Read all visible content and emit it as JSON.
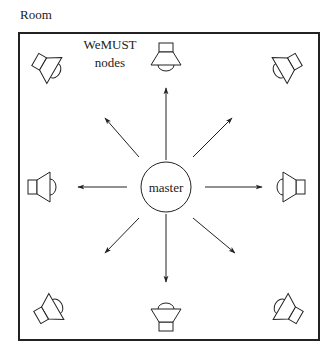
{
  "diagram": {
    "room_label": "Room",
    "nodes_label_line1": "WeMUST",
    "nodes_label_line2": "nodes",
    "master_label": "master",
    "caption_partial": "",
    "stroke_color": "#222222",
    "background": "#ffffff",
    "layout": {
      "room_rect": {
        "x": 19,
        "y": 33,
        "w": 300,
        "h": 307
      },
      "master_center": [
        166,
        187
      ],
      "master_radius": 25,
      "speakers": [
        {
          "position": "top-left",
          "orientation": "diagonal",
          "facing": "center"
        },
        {
          "position": "top-center",
          "orientation": "vertical",
          "facing": "down"
        },
        {
          "position": "top-right",
          "orientation": "diagonal",
          "facing": "center"
        },
        {
          "position": "middle-left",
          "orientation": "horizontal",
          "facing": "right"
        },
        {
          "position": "middle-right",
          "orientation": "horizontal",
          "facing": "left"
        },
        {
          "position": "bottom-left",
          "orientation": "diagonal",
          "facing": "center"
        },
        {
          "position": "bottom-center",
          "orientation": "vertical",
          "facing": "up"
        },
        {
          "position": "bottom-right",
          "orientation": "diagonal",
          "facing": "center"
        }
      ],
      "arrows": [
        {
          "direction": "up",
          "from": [
            166,
            160
          ],
          "to": [
            166,
            88
          ]
        },
        {
          "direction": "down",
          "from": [
            166,
            214
          ],
          "to": [
            166,
            282
          ]
        },
        {
          "direction": "left",
          "from": [
            127,
            187
          ],
          "to": [
            78,
            187
          ]
        },
        {
          "direction": "right",
          "from": [
            205,
            187
          ],
          "to": [
            262,
            187
          ]
        },
        {
          "direction": "up-left",
          "from": [
            139,
            157
          ],
          "to": [
            105,
            118
          ]
        },
        {
          "direction": "up-right",
          "from": [
            193,
            157
          ],
          "to": [
            232,
            118
          ]
        },
        {
          "direction": "down-left",
          "from": [
            139,
            218
          ],
          "to": [
            105,
            253
          ]
        },
        {
          "direction": "down-right",
          "from": [
            193,
            218
          ],
          "to": [
            235,
            253
          ]
        }
      ]
    }
  }
}
